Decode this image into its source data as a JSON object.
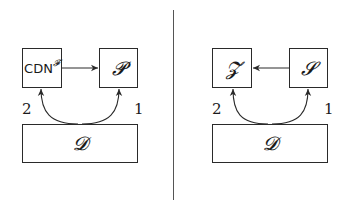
{
  "left_panel": {
    "box_top_left": {
      "label": "CDN",
      "superscript": "𝓕"
    },
    "box_top_right": {
      "label": "𝓟"
    },
    "box_bottom": {
      "label": "𝓓"
    },
    "edge_top": {
      "from": "CDN^F",
      "to": "P"
    },
    "arc_labels": {
      "left": "2",
      "right": "1"
    }
  },
  "right_panel": {
    "box_top_left": {
      "label": "𝓩"
    },
    "box_top_right": {
      "label": "𝓢"
    },
    "box_bottom": {
      "label": "𝓓"
    },
    "edge_top": {
      "from": "S",
      "to": "Z"
    },
    "arc_labels": {
      "left": "2",
      "right": "1"
    }
  },
  "colors": {
    "stroke": "#2a2a2a",
    "divider": "#555555",
    "background": "#ffffff"
  }
}
